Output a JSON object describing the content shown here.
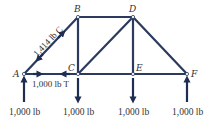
{
  "diagram": {
    "colors": {
      "member": "#2b3a5e",
      "arrow": "#1f2d52",
      "text": "#333333"
    },
    "nodes": [
      {
        "id": "A",
        "x": 24,
        "y": 74
      },
      {
        "id": "B",
        "x": 78,
        "y": 17
      },
      {
        "id": "C",
        "x": 78,
        "y": 74
      },
      {
        "id": "D",
        "x": 133,
        "y": 17
      },
      {
        "id": "E",
        "x": 133,
        "y": 74
      },
      {
        "id": "F",
        "x": 187,
        "y": 74
      }
    ],
    "node_labels": {
      "A": "A",
      "B": "B",
      "C": "C",
      "D": "D",
      "E": "E",
      "F": "F"
    },
    "members": [
      "AB",
      "AC",
      "BC",
      "BD",
      "CD",
      "CE",
      "DE",
      "DF",
      "EF"
    ],
    "member_forces": {
      "AB": "1,414 lb C",
      "AC": "1,000 lb T"
    },
    "loads": {
      "A": {
        "label": "1,000 lb",
        "direction": "up"
      },
      "C": {
        "label": "1,000 lb",
        "direction": "down"
      },
      "E": {
        "label": "1,000 lb",
        "direction": "down"
      },
      "F": {
        "label": "1,000 lb",
        "direction": "up"
      }
    }
  }
}
